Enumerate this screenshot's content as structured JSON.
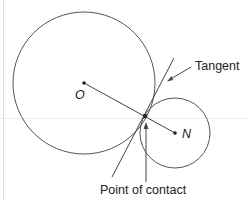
{
  "diagram": {
    "colors": {
      "stroke": "#555555",
      "guide": "#e6e6e6",
      "text": "#222222"
    },
    "labels": {
      "center_large": "O",
      "center_small": "N",
      "tangent": "Tangent",
      "contact": "Point of contact"
    },
    "shapes": {
      "large_circle": {
        "cx": 84,
        "cy": 83,
        "r": 71
      },
      "small_circle": {
        "cx": 175,
        "cy": 133,
        "r": 35
      },
      "contact_point": {
        "x": 145,
        "y": 116
      },
      "tangent_line": {
        "x1": 112,
        "y1": 177,
        "x2": 174,
        "y2": 58
      }
    }
  }
}
